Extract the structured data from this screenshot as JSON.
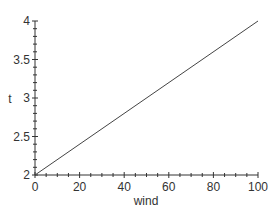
{
  "chart_data": {
    "type": "line",
    "title": "",
    "xlabel": "wind",
    "ylabel": "t",
    "xlim": [
      0,
      100
    ],
    "ylim": [
      2,
      4
    ],
    "x_ticks": [
      0,
      20,
      40,
      60,
      80,
      100
    ],
    "x_tick_labels": [
      "0",
      "20",
      "40",
      "60",
      "80",
      "100"
    ],
    "x_minor_step": 5,
    "y_ticks": [
      2,
      2.5,
      3,
      3.5,
      4
    ],
    "y_tick_labels": [
      "2",
      "2.5",
      "3",
      "3.5",
      "4"
    ],
    "y_minor_step": 0.1,
    "grid": false,
    "legend": null,
    "series": [
      {
        "name": "t",
        "x": [
          0,
          100
        ],
        "y": [
          2,
          4
        ],
        "color": "#444444"
      }
    ]
  },
  "colors": {
    "axis": "#333333",
    "line": "#444444",
    "background": "#ffffff"
  }
}
